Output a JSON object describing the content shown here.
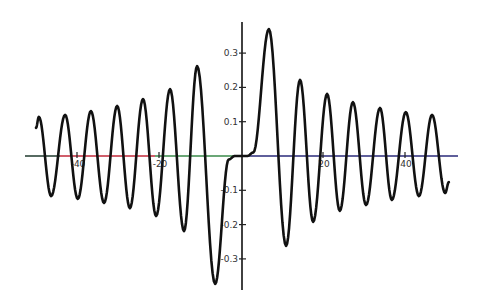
{
  "chart_data": {
    "type": "line",
    "title": "",
    "xlabel": "",
    "ylabel": "",
    "xlim": [
      -52,
      53
    ],
    "ylim": [
      -0.39,
      0.39
    ],
    "grid": false,
    "legend": null,
    "x_ticks": [
      {
        "value": -40,
        "label": "-40"
      },
      {
        "value": -20,
        "label": "-20"
      },
      {
        "value": 20,
        "label": "20"
      },
      {
        "value": 40,
        "label": "40"
      }
    ],
    "y_ticks": [
      {
        "value": 0.3,
        "label": "0.3"
      },
      {
        "value": 0.2,
        "label": "0.2"
      },
      {
        "value": 0.1,
        "label": "0.1"
      },
      {
        "value": -0.1,
        "label": "-0.1"
      },
      {
        "value": -0.2,
        "label": "-0.2"
      },
      {
        "value": -0.3,
        "label": "-0.3"
      }
    ],
    "series": [
      {
        "name": "curve",
        "color": "#111111",
        "points": [
          [
            -50.0,
            0.082
          ],
          [
            -49.3,
            0.114
          ],
          [
            -46.3,
            -0.117
          ],
          [
            -42.9,
            0.12
          ],
          [
            -39.8,
            -0.125
          ],
          [
            -36.6,
            0.131
          ],
          [
            -33.4,
            -0.137
          ],
          [
            -30.2,
            0.146
          ],
          [
            -27.1,
            -0.152
          ],
          [
            -23.9,
            0.166
          ],
          [
            -20.7,
            -0.175
          ],
          [
            -17.3,
            0.195
          ],
          [
            -13.9,
            -0.219
          ],
          [
            -10.7,
            0.262
          ],
          [
            -6.3,
            -0.373
          ],
          [
            -3.0,
            -0.01
          ],
          [
            -1.5,
            0.0
          ],
          [
            1.5,
            0.0
          ],
          [
            3.0,
            0.01
          ],
          [
            6.8,
            0.37
          ],
          [
            11.0,
            -0.262
          ],
          [
            14.4,
            0.222
          ],
          [
            17.6,
            -0.192
          ],
          [
            21.0,
            0.181
          ],
          [
            24.1,
            -0.16
          ],
          [
            27.3,
            0.157
          ],
          [
            30.5,
            -0.143
          ],
          [
            33.9,
            0.14
          ],
          [
            36.8,
            -0.128
          ],
          [
            40.2,
            0.128
          ],
          [
            43.4,
            -0.117
          ],
          [
            46.6,
            0.12
          ],
          [
            49.8,
            -0.108
          ],
          [
            50.7,
            -0.076
          ]
        ]
      }
    ],
    "axis_colors": {
      "x_axis_segments": [
        {
          "from_px": 25,
          "to_px": 60,
          "color": "#1f3a2e"
        },
        {
          "from_px": 60,
          "to_px": 155,
          "color": "#c0283a"
        },
        {
          "from_px": 155,
          "to_px": 242,
          "color": "#3a8a4a"
        },
        {
          "from_px": 242,
          "to_px": 458,
          "color": "#2a2a7a"
        }
      ],
      "y_axis": "#111111"
    }
  }
}
